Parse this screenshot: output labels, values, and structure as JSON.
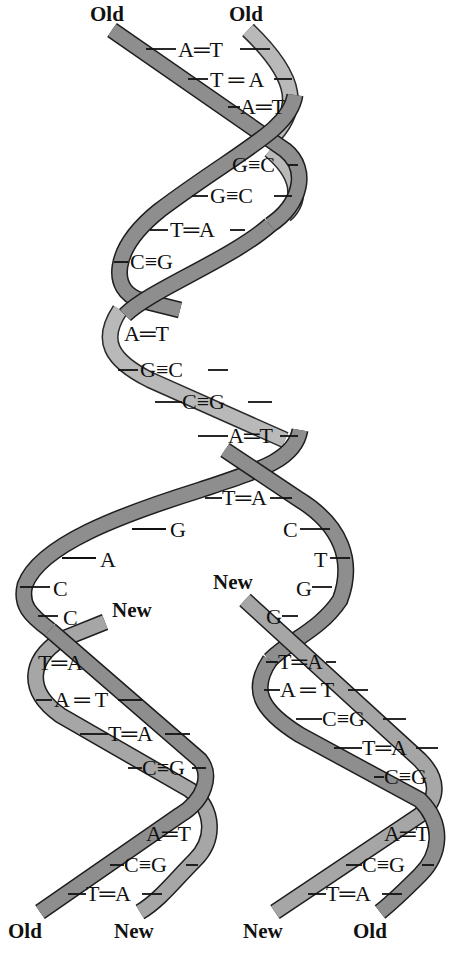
{
  "labels": {
    "top_left": "Old",
    "top_right": "Old",
    "new_left_strand": "New",
    "new_right_strand": "New",
    "bottom_left_old": "Old",
    "bottom_left_new": "New",
    "bottom_right_new": "New",
    "bottom_right_old": "Old"
  },
  "colors": {
    "old_strand": "#8e8e8e",
    "old_strand_back": "#b9b9b9",
    "new_strand": "#a6a6a6",
    "outline": "#1e1e1e"
  },
  "parent_helix": {
    "base_pairs": [
      {
        "left": "A",
        "bond": "=",
        "right": "T"
      },
      {
        "left": "T",
        "bond": "=",
        "right": "A"
      },
      {
        "left": "A",
        "bond": "=",
        "right": "T"
      },
      {
        "left": "G",
        "bond": "≡",
        "right": "C"
      },
      {
        "left": "G",
        "bond": "≡",
        "right": "C"
      },
      {
        "left": "T",
        "bond": "=",
        "right": "A"
      },
      {
        "left": "C",
        "bond": "≡",
        "right": "G"
      },
      {
        "left": "A",
        "bond": "=",
        "right": "T"
      },
      {
        "left": "G",
        "bond": "≡",
        "right": "C"
      },
      {
        "left": "C",
        "bond": "≡",
        "right": "G"
      },
      {
        "left": "A",
        "bond": "=",
        "right": "T"
      },
      {
        "left": "T",
        "bond": "=",
        "right": "A"
      }
    ]
  },
  "fork": {
    "left_unpaired": [
      "G",
      "A",
      "C",
      "C"
    ],
    "right_unpaired": [
      "C",
      "T",
      "G",
      "G"
    ]
  },
  "daughter_left": {
    "base_pairs": [
      {
        "left": "T",
        "bond": "=",
        "right": "A"
      },
      {
        "left": "A",
        "bond": "=",
        "right": "T"
      },
      {
        "left": "T",
        "bond": "=",
        "right": "A"
      },
      {
        "left": "C",
        "bond": "≡",
        "right": "G"
      },
      {
        "left": "A",
        "bond": "=",
        "right": "T"
      },
      {
        "left": "C",
        "bond": "≡",
        "right": "G"
      },
      {
        "left": "T",
        "bond": "=",
        "right": "A"
      }
    ]
  },
  "daughter_right": {
    "base_pairs": [
      {
        "left": "T",
        "bond": "=",
        "right": "A"
      },
      {
        "left": "A",
        "bond": "=",
        "right": "T"
      },
      {
        "left": "C",
        "bond": "≡",
        "right": "G"
      },
      {
        "left": "T",
        "bond": "=",
        "right": "A"
      },
      {
        "left": "C",
        "bond": "≡",
        "right": "G"
      },
      {
        "left": "A",
        "bond": "=",
        "right": "T"
      },
      {
        "left": "C",
        "bond": "≡",
        "right": "G"
      },
      {
        "left": "T",
        "bond": "=",
        "right": "A"
      }
    ]
  },
  "base_text": {
    "p0": "A═T",
    "p1": "T ═ A",
    "p2": "A═T",
    "p3": "G≡C",
    "p4": "G≡C",
    "p5": "T═A",
    "p6": "C≡G",
    "p7": "A═T",
    "p8": "G≡C",
    "p9": "C≡G",
    "p10": "A═T",
    "p11": "T═A",
    "fl0": "G",
    "fl1": "A",
    "fl2": "C",
    "fl3": "C",
    "fr0": "C",
    "fr1": "T",
    "fr2": "G",
    "fr3": "G",
    "l0": "T═A",
    "l1": "A ═ T",
    "l2": "T═A",
    "l3": "C≡G",
    "l4": "A═T",
    "l5": "C≡G",
    "l6": "T═A",
    "r0": "T═A",
    "r1": "A ═ T",
    "r2": "C≡G",
    "r3": "T═A",
    "r4": "C≡G",
    "r5": "A═T",
    "r6": "C≡G",
    "r7": "T═A"
  }
}
